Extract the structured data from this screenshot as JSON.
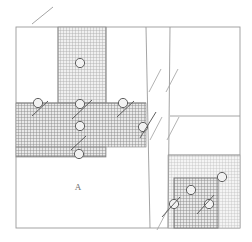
{
  "drawing": {
    "title": "Structural connection detail drawing",
    "kind": "line-drawing",
    "background_color": "#ffffff",
    "line_color": "#8c8c8c",
    "dark_line_color": "#5a5a5a",
    "hatch_color": "#9a9a9a",
    "light_fill": "#cfcfcf",
    "medium_fill": "#b5b5b5",
    "dark_fill": "#9e9e9e",
    "labels": [
      {
        "id": "region-a",
        "text": "A",
        "x": 78,
        "y": 190
      }
    ],
    "outline": {
      "left": 16,
      "top": 27,
      "right": 240,
      "bottom": 228
    },
    "regions": [
      {
        "id": "upper-column",
        "name": "vertical-hatched-column",
        "x": 58,
        "y": 27,
        "w": 48,
        "h": 76,
        "fill": "medium"
      },
      {
        "id": "middle-beam-left",
        "name": "horizontal-hatched-band",
        "x": 16,
        "y": 103,
        "w": 130,
        "h": 44,
        "fill": "dark"
      },
      {
        "id": "middle-beam-stub",
        "name": "horizontal-band-lower-stub",
        "x": 16,
        "y": 147,
        "w": 90,
        "h": 9,
        "fill": "dark"
      },
      {
        "id": "lower-right-plate",
        "name": "lower-right-shaded-plate",
        "x": 168,
        "y": 155,
        "w": 72,
        "h": 73,
        "fill": "light"
      },
      {
        "id": "lower-right-block",
        "name": "lower-right-hatched-block",
        "x": 174,
        "y": 178,
        "w": 44,
        "h": 50,
        "fill": "dark"
      }
    ],
    "markers": [
      {
        "id": "m1",
        "name": "bolt-marker",
        "cx": 80,
        "cy": 63,
        "r": 5,
        "tick": false
      },
      {
        "id": "m2",
        "name": "bolt-marker",
        "cx": 38,
        "cy": 103,
        "r": 5,
        "tick": true
      },
      {
        "id": "m3",
        "name": "bolt-marker",
        "cx": 80,
        "cy": 104,
        "r": 5,
        "tick": true
      },
      {
        "id": "m4",
        "name": "bolt-marker",
        "cx": 123,
        "cy": 103,
        "r": 5,
        "tick": true
      },
      {
        "id": "m5",
        "name": "bolt-marker",
        "cx": 80,
        "cy": 126,
        "r": 5,
        "tick": false
      },
      {
        "id": "m6",
        "name": "bolt-marker",
        "cx": 143,
        "cy": 127,
        "r": 5,
        "tick": true
      },
      {
        "id": "m7",
        "name": "bolt-marker",
        "cx": 79,
        "cy": 154,
        "r": 5,
        "tick": true
      },
      {
        "id": "m8",
        "name": "bolt-marker",
        "cx": 191,
        "cy": 190,
        "r": 5,
        "tick": false
      },
      {
        "id": "m9",
        "name": "bolt-marker",
        "cx": 222,
        "cy": 177,
        "r": 5,
        "tick": false
      },
      {
        "id": "m10",
        "name": "bolt-marker",
        "cx": 174,
        "cy": 204,
        "r": 5,
        "tick": true
      },
      {
        "id": "m11",
        "name": "bolt-marker",
        "cx": 209,
        "cy": 204,
        "r": 5,
        "tick": true
      }
    ],
    "leader_lines": [
      {
        "id": "l1",
        "name": "leader-line-top",
        "x1": 32,
        "y1": 24,
        "x2": 53,
        "y2": 7
      }
    ],
    "break_marks": [
      {
        "id": "b1",
        "name": "break-hatch-stroke",
        "x1": 149,
        "y1": 92,
        "x2": 161,
        "y2": 69
      },
      {
        "id": "b2",
        "name": "break-hatch-stroke",
        "x1": 166,
        "y1": 92,
        "x2": 178,
        "y2": 69
      },
      {
        "id": "b3",
        "name": "break-hatch-stroke",
        "x1": 150,
        "y1": 140,
        "x2": 162,
        "y2": 117
      },
      {
        "id": "b4",
        "name": "break-hatch-stroke",
        "x1": 167,
        "y1": 140,
        "x2": 179,
        "y2": 117
      },
      {
        "id": "b5",
        "name": "break-hatch-stroke",
        "x1": 157,
        "y1": 230,
        "x2": 169,
        "y2": 207
      }
    ],
    "dividers": [
      {
        "id": "d1",
        "name": "vertical-gap-left-edge",
        "x1": 146,
        "y1": 27,
        "x2": 150,
        "y2": 228
      },
      {
        "id": "d2",
        "name": "vertical-gap-right-edge",
        "x1": 170,
        "y1": 27,
        "x2": 168,
        "y2": 228
      },
      {
        "id": "d3",
        "name": "right-panel-horizontal-divider",
        "x1": 170,
        "y1": 116,
        "x2": 240,
        "y2": 116
      },
      {
        "id": "d4",
        "name": "plate-top-edge",
        "x1": 168,
        "y1": 155,
        "x2": 240,
        "y2": 155
      },
      {
        "id": "d5",
        "name": "beam-top-edge",
        "x1": 16,
        "y1": 103,
        "x2": 146,
        "y2": 103
      },
      {
        "id": "d6",
        "name": "beam-bottom-edge",
        "x1": 16,
        "y1": 156,
        "x2": 106,
        "y2": 156
      }
    ]
  }
}
